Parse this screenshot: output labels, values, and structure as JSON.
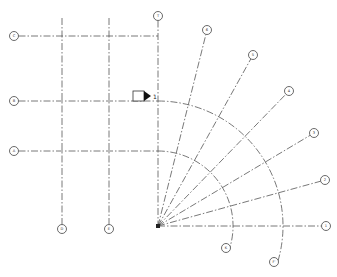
{
  "drawing": {
    "type": "structural grid plan with radial grid lines",
    "origin": {
      "x": 158,
      "y": 226
    }
  },
  "grids": {
    "horizontal": [
      {
        "label": "C",
        "y": 36,
        "bubble": {
          "x": 14,
          "y": 36
        }
      },
      {
        "label": "B",
        "y": 101,
        "bubble": {
          "x": 14,
          "y": 101
        }
      },
      {
        "label": "A",
        "y": 151,
        "bubble": {
          "x": 14,
          "y": 151
        }
      }
    ],
    "vertical": [
      {
        "label": "D",
        "x": 62,
        "bubble": {
          "x": 62,
          "y": 229
        }
      },
      {
        "label": "E",
        "x": 109,
        "bubble": {
          "x": 109,
          "y": 229
        }
      },
      {
        "label": "T",
        "x": 158,
        "bubble": {
          "x": 158,
          "y": 16
        }
      }
    ],
    "radial": [
      {
        "label": "6",
        "bubble": {
          "x": 207,
          "y": 30
        }
      },
      {
        "label": "5",
        "bubble": {
          "x": 253,
          "y": 55
        }
      },
      {
        "label": "4",
        "bubble": {
          "x": 289,
          "y": 91
        }
      },
      {
        "label": "3",
        "bubble": {
          "x": 314,
          "y": 133
        }
      },
      {
        "label": "2",
        "bubble": {
          "x": 325,
          "y": 180
        }
      },
      {
        "label": "1",
        "bubble": {
          "x": 326,
          "y": 226
        }
      }
    ],
    "arcs": [
      {
        "label": "K",
        "radius": 75,
        "bubble": {
          "x": 226,
          "y": 248
        }
      },
      {
        "label": "F'",
        "radius": 125,
        "bubble": {
          "x": 274,
          "y": 262
        }
      }
    ]
  },
  "section_marker": {
    "label": "1",
    "x": 133,
    "y": 91
  }
}
